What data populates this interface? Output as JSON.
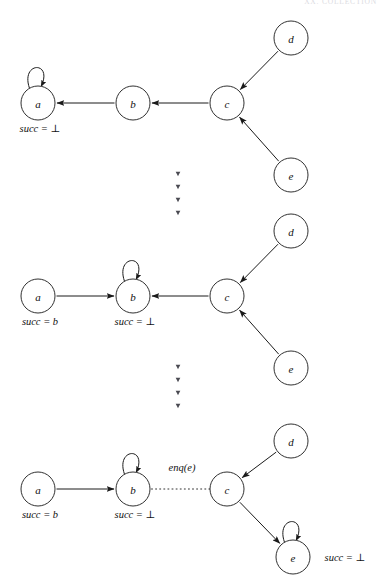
{
  "page": {
    "running_head": "XX. COLLECTION",
    "width": 385,
    "height": 587,
    "background": "#ffffff",
    "ink_color": "#1a1a1a"
  },
  "figure": {
    "caption": "",
    "panels": [
      {
        "id": "panel-1",
        "nodes": [
          {
            "id": "a",
            "label": "a",
            "cx": 38,
            "cy": 103,
            "r": 17,
            "self_loop": true,
            "succ_label": "succ = ⊥",
            "succ_x": 40,
            "succ_y": 132
          },
          {
            "id": "b",
            "label": "b",
            "cx": 133,
            "cy": 103,
            "r": 17,
            "self_loop": false,
            "succ_label": "",
            "succ_x": 0,
            "succ_y": 0
          },
          {
            "id": "c",
            "label": "c",
            "cx": 227,
            "cy": 103,
            "r": 17,
            "self_loop": false,
            "succ_label": "",
            "succ_x": 0,
            "succ_y": 0
          },
          {
            "id": "d",
            "label": "d",
            "cx": 291,
            "cy": 38,
            "r": 17,
            "self_loop": false,
            "succ_label": "",
            "succ_x": 0,
            "succ_y": 0
          },
          {
            "id": "e",
            "label": "e",
            "cx": 291,
            "cy": 175,
            "r": 17,
            "self_loop": false,
            "succ_label": "",
            "succ_x": 0,
            "succ_y": 0
          }
        ],
        "edges": [
          {
            "from": "b",
            "to": "a",
            "style": "solid",
            "label": ""
          },
          {
            "from": "c",
            "to": "b",
            "style": "solid",
            "label": ""
          },
          {
            "from": "d",
            "to": "c",
            "style": "solid",
            "label": ""
          },
          {
            "from": "e",
            "to": "c",
            "style": "solid",
            "label": ""
          }
        ]
      },
      {
        "id": "panel-2",
        "nodes": [
          {
            "id": "a",
            "label": "a",
            "cx": 38,
            "cy": 296,
            "r": 17,
            "self_loop": false,
            "succ_label": "succ = b",
            "succ_x": 40,
            "succ_y": 325
          },
          {
            "id": "b",
            "label": "b",
            "cx": 133,
            "cy": 296,
            "r": 17,
            "self_loop": true,
            "succ_label": "succ = ⊥",
            "succ_x": 135,
            "succ_y": 325
          },
          {
            "id": "c",
            "label": "c",
            "cx": 227,
            "cy": 296,
            "r": 17,
            "self_loop": false,
            "succ_label": "",
            "succ_x": 0,
            "succ_y": 0
          },
          {
            "id": "d",
            "label": "d",
            "cx": 291,
            "cy": 231,
            "r": 17,
            "self_loop": false,
            "succ_label": "",
            "succ_x": 0,
            "succ_y": 0
          },
          {
            "id": "e",
            "label": "e",
            "cx": 291,
            "cy": 368,
            "r": 17,
            "self_loop": false,
            "succ_label": "",
            "succ_x": 0,
            "succ_y": 0
          }
        ],
        "edges": [
          {
            "from": "a",
            "to": "b",
            "style": "solid",
            "label": ""
          },
          {
            "from": "c",
            "to": "b",
            "style": "solid",
            "label": ""
          },
          {
            "from": "d",
            "to": "c",
            "style": "solid",
            "label": ""
          },
          {
            "from": "e",
            "to": "c",
            "style": "solid",
            "label": ""
          }
        ]
      },
      {
        "id": "panel-3",
        "nodes": [
          {
            "id": "a",
            "label": "a",
            "cx": 38,
            "cy": 489,
            "r": 17,
            "self_loop": false,
            "succ_label": "succ = b",
            "succ_x": 40,
            "succ_y": 518
          },
          {
            "id": "b",
            "label": "b",
            "cx": 133,
            "cy": 489,
            "r": 17,
            "self_loop": true,
            "succ_label": "succ = ⊥",
            "succ_x": 135,
            "succ_y": 518
          },
          {
            "id": "c",
            "label": "c",
            "cx": 227,
            "cy": 489,
            "r": 17,
            "self_loop": false,
            "succ_label": "",
            "succ_x": 0,
            "succ_y": 0
          },
          {
            "id": "d",
            "label": "d",
            "cx": 291,
            "cy": 441,
            "r": 17,
            "self_loop": false,
            "succ_label": "",
            "succ_x": 0,
            "succ_y": 0
          },
          {
            "id": "e",
            "label": "e",
            "cx": 293,
            "cy": 557,
            "r": 17,
            "self_loop": true,
            "succ_label": "succ = ⊥",
            "succ_x": 345,
            "succ_y": 561
          }
        ],
        "edges": [
          {
            "from": "a",
            "to": "b",
            "style": "solid",
            "label": ""
          },
          {
            "from": "b",
            "to": "c",
            "style": "dotted",
            "label": "enq(e)"
          },
          {
            "from": "d",
            "to": "c",
            "style": "solid",
            "label": ""
          },
          {
            "from": "c",
            "to": "e",
            "style": "solid",
            "label": ""
          }
        ],
        "edge_label": "enq(e)",
        "edge_label_x": 182,
        "edge_label_y": 471
      }
    ],
    "separators": [
      {
        "id": "separator-1",
        "x": 178,
        "y_start": 174,
        "dot_count": 4,
        "spacing": 13
      },
      {
        "id": "separator-2",
        "x": 178,
        "y_start": 367,
        "dot_count": 4,
        "spacing": 13
      }
    ]
  }
}
